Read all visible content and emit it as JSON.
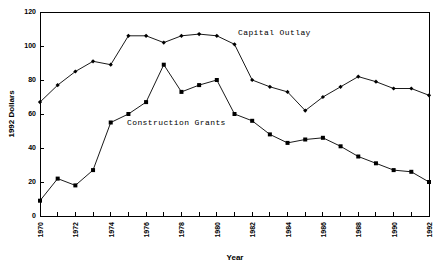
{
  "chart_data": {
    "type": "line",
    "title": "",
    "xlabel": "Year",
    "ylabel": "1992 Dollars",
    "xlim": [
      1970,
      1992
    ],
    "ylim": [
      0,
      120
    ],
    "ytick_values": [
      0,
      20,
      40,
      60,
      80,
      100,
      120
    ],
    "ytick_labels": [
      "0",
      "20",
      "40",
      "60",
      "80",
      "100",
      "120"
    ],
    "xtick_values": [
      1970,
      1971,
      1972,
      1973,
      1974,
      1975,
      1976,
      1977,
      1978,
      1979,
      1980,
      1981,
      1982,
      1983,
      1984,
      1985,
      1986,
      1987,
      1988,
      1989,
      1990,
      1991,
      1992
    ],
    "xtick_labels": [
      "1970",
      "",
      "1972",
      "",
      "1974",
      "",
      "1976",
      "",
      "1978",
      "",
      "1980",
      "",
      "1982",
      "",
      "1984",
      "",
      "1986",
      "",
      "1988",
      "",
      "1990",
      "",
      "1992"
    ],
    "grid": false,
    "legend_position": "inline-annotation",
    "x": [
      1970,
      1971,
      1972,
      1973,
      1974,
      1975,
      1976,
      1977,
      1978,
      1979,
      1980,
      1981,
      1982,
      1983,
      1984,
      1985,
      1986,
      1987,
      1988,
      1989,
      1990,
      1991,
      1992
    ],
    "series": [
      {
        "name": "Capital Outlay",
        "label": "Capital Outlay",
        "marker": "diamond",
        "values": [
          67,
          77,
          85,
          91,
          89,
          106,
          106,
          102,
          106,
          107,
          106,
          101,
          80,
          76,
          73,
          62,
          70,
          76,
          82,
          79,
          75,
          75,
          71
        ]
      },
      {
        "name": "Construction Grants",
        "label": "Construction Grants",
        "marker": "square",
        "values": [
          9,
          22,
          18,
          27,
          55,
          60,
          67,
          89,
          73,
          77,
          80,
          60,
          56,
          48,
          43,
          45,
          46,
          41,
          35,
          31,
          27,
          26,
          20
        ]
      }
    ],
    "annotations": [
      {
        "text": "Capital Outlay",
        "x_px": 238,
        "y_px": 35
      },
      {
        "text": "Construction Grants",
        "x_px": 127,
        "y_px": 125
      }
    ]
  },
  "axis": {
    "y_axis_title": "1992 Dollars",
    "x_axis_title": "Year"
  }
}
